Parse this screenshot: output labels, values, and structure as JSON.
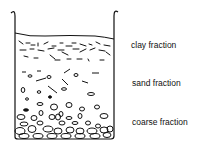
{
  "diagram": {
    "labels": {
      "clay": "clay fraction",
      "sand": "sand fraction",
      "coarse": "coarse fraction"
    },
    "colors": {
      "stroke": "#111111",
      "background": "#ffffff"
    }
  }
}
